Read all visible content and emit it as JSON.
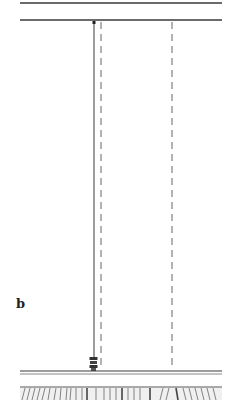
{
  "figure": {
    "panel_label": "b",
    "colors": {
      "line": "#3a3a3a",
      "dashed": "#555555",
      "floor_hatch": "#666666",
      "background": "#ffffff"
    },
    "elements": {
      "top_ceiling_line": {
        "x1": 20,
        "x2": 222,
        "y": 3
      },
      "second_ceiling_line": {
        "x1": 20,
        "x2": 222,
        "y": 20
      },
      "pendulum_string": {
        "x": 94,
        "y1": 24,
        "y2": 358
      },
      "dashed_line_left": {
        "x": 101,
        "y1": 22,
        "y2": 370
      },
      "dashed_line_right": {
        "x": 172,
        "y1": 22,
        "y2": 370
      },
      "floor_line": {
        "x1": 20,
        "x2": 222,
        "y": 372
      },
      "hatched_floor": {
        "x1": 20,
        "x2": 222,
        "y1": 386,
        "y2": 400
      }
    }
  }
}
